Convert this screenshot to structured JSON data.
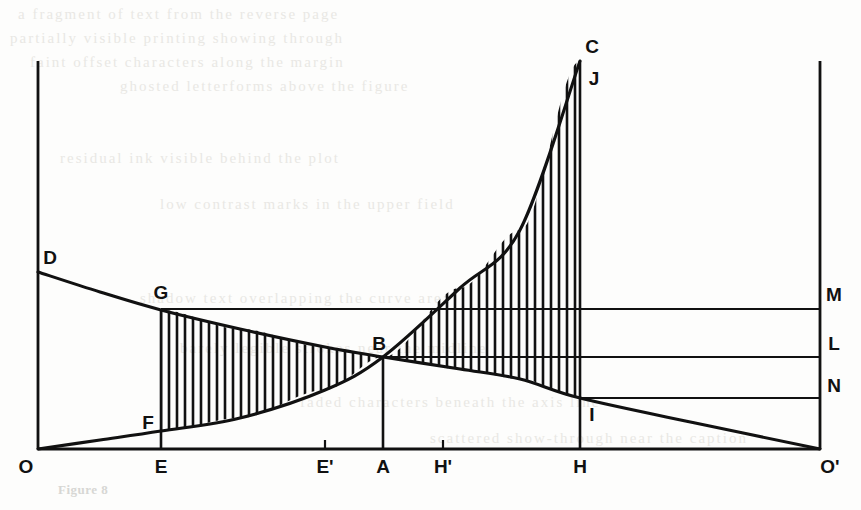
{
  "figure": {
    "caption": "Figure 8",
    "background_color": "#fdfdfc",
    "ink_color": "#111111"
  },
  "chart_data": {
    "type": "line",
    "title": "",
    "xlabel": "",
    "ylabel": "",
    "grid": false,
    "legend": null,
    "axis_ranges": {
      "x": [
        38,
        820
      ],
      "y": [
        449,
        61
      ]
    },
    "axes": [
      {
        "name": "left-vertical-axis",
        "x1": 38,
        "y1": 61,
        "x2": 38,
        "y2": 449
      },
      {
        "name": "right-vertical-axis",
        "x1": 820,
        "y1": 61,
        "x2": 820,
        "y2": 449
      },
      {
        "name": "baseline-horizontal-axis",
        "x1": 38,
        "y1": 449,
        "x2": 820,
        "y2": 449
      }
    ],
    "points": [
      {
        "id": "O",
        "label": "O",
        "x": 38,
        "y": 449,
        "label_x": 26,
        "label_y": 468
      },
      {
        "id": "D",
        "label": "D",
        "x": 38,
        "y": 272,
        "label_x": 50,
        "label_y": 259
      },
      {
        "id": "E",
        "label": "E",
        "x": 161,
        "y": 449,
        "label_x": 161,
        "label_y": 468
      },
      {
        "id": "G",
        "label": "G",
        "x": 161,
        "y": 310,
        "label_x": 161,
        "label_y": 294
      },
      {
        "id": "F",
        "label": "F",
        "x": 161,
        "y": 431,
        "label_x": 148,
        "label_y": 424
      },
      {
        "id": "Ep",
        "label": "E'",
        "x": 325,
        "y": 449,
        "label_x": 325,
        "label_y": 468
      },
      {
        "id": "A",
        "label": "A",
        "x": 383,
        "y": 449,
        "label_x": 383,
        "label_y": 468
      },
      {
        "id": "B",
        "label": "B",
        "x": 383,
        "y": 357,
        "label_x": 379,
        "label_y": 345
      },
      {
        "id": "Hp",
        "label": "H'",
        "x": 443,
        "y": 449,
        "label_x": 443,
        "label_y": 468
      },
      {
        "id": "H",
        "label": "H",
        "x": 580,
        "y": 449,
        "label_x": 580,
        "label_y": 468
      },
      {
        "id": "C",
        "label": "C",
        "x": 580,
        "y": 61,
        "label_x": 592,
        "label_y": 48
      },
      {
        "id": "J",
        "label": "J",
        "x": 580,
        "y": 88,
        "label_x": 594,
        "label_y": 80
      },
      {
        "id": "I",
        "label": "I",
        "x": 580,
        "y": 398,
        "label_x": 592,
        "label_y": 416
      },
      {
        "id": "M",
        "label": "M",
        "x": 820,
        "y": 308,
        "label_x": 834,
        "label_y": 296
      },
      {
        "id": "L",
        "label": "L",
        "x": 820,
        "y": 357,
        "label_x": 834,
        "label_y": 345
      },
      {
        "id": "N",
        "label": "N",
        "x": 820,
        "y": 398,
        "label_x": 834,
        "label_y": 387
      },
      {
        "id": "Op",
        "label": "O'",
        "x": 820,
        "y": 449,
        "label_x": 830,
        "label_y": 468
      }
    ],
    "tick_marks": [
      {
        "at": "E'",
        "x": 325,
        "y": 449
      },
      {
        "at": "H'",
        "x": 443,
        "y": 449
      }
    ],
    "verticals": [
      {
        "name": "E-ordinate",
        "x": 161,
        "y_top": 310,
        "y_bottom": 449
      },
      {
        "name": "A-ordinate",
        "x": 383,
        "y_top": 357,
        "y_bottom": 449
      },
      {
        "name": "H-ordinate",
        "x": 580,
        "y_top": 61,
        "y_bottom": 449
      }
    ],
    "horizontals": [
      {
        "name": "GM-level",
        "from": "G",
        "to": "M",
        "x1": 161,
        "x2": 820,
        "y": 309
      },
      {
        "name": "BL-level",
        "from": "B",
        "to": "L",
        "x1": 383,
        "x2": 820,
        "y": 357
      },
      {
        "name": "IN-level",
        "from": "I",
        "to": "N",
        "x1": 580,
        "x2": 820,
        "y": 398
      }
    ],
    "series": [
      {
        "name": "descending-curve-D-to-Op",
        "description": "Convex decreasing curve from D on left axis through G and B, flattening to I and ending at O'",
        "style": "curve",
        "x": [
          38,
          100,
          161,
          240,
          325,
          383,
          460,
          520,
          580,
          700,
          820
        ],
        "y": [
          272,
          292,
          310,
          329,
          347,
          357,
          369,
          379,
          398,
          424,
          449
        ]
      },
      {
        "name": "ascending-curve-O-to-C",
        "description": "Increasing curve from origin O, concave up through F and E', straightening into the line B to C at H",
        "style": "curve",
        "x": [
          38,
          100,
          161,
          240,
          325,
          383,
          460,
          520,
          580
        ],
        "y": [
          449,
          440,
          431,
          418,
          390,
          357,
          288,
          230,
          61
        ]
      }
    ],
    "hatched_regions": [
      {
        "name": "left-hatched-region-GFE-to-B",
        "description": "Vertical hatching between the descending curve (top) and the ascending curve (bottom) from ordinate E to point B",
        "x_start": 161,
        "x_end": 383,
        "hatch_direction": "vertical",
        "hatch_spacing_px": 8
      },
      {
        "name": "right-hatched-region-B-C-J-I",
        "description": "Vertical hatching between the ascending line B-C (top) and the descending curve B-I (bottom) from point B to ordinate H",
        "x_start": 383,
        "x_end": 580,
        "hatch_direction": "vertical",
        "hatch_spacing_px": 8
      }
    ]
  },
  "bleedthrough": {
    "lines": [
      "a fragment of text from the reverse page",
      "partially visible printing showing through",
      "faint offset characters along the margin",
      "ghosted letterforms above the figure",
      "residual ink visible behind the plot",
      "low contrast marks in the upper field",
      "shadow text overlapping the curve area",
      "barely legible strokes near the midline",
      "faded characters beneath the axis line",
      "scattered show-through near the caption"
    ]
  }
}
